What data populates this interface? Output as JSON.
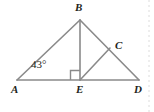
{
  "figure": {
    "kind": "geometry-diagram",
    "background_color": "#ffffff",
    "stroke_color": "#8a8a8a",
    "label_color": "#231f20",
    "guide_color": "#d9d9d9",
    "points": {
      "A": {
        "label": "A",
        "x": 17,
        "y": 80
      },
      "B": {
        "label": "B",
        "x": 80,
        "y": 20
      },
      "C": {
        "label": "C",
        "x": 110,
        "y": 48
      },
      "D": {
        "label": "D",
        "x": 139,
        "y": 80
      },
      "E": {
        "label": "E",
        "x": 80,
        "y": 80
      }
    },
    "segments": [
      {
        "name": "segment-AD",
        "from": "A",
        "to": "D"
      },
      {
        "name": "segment-AB",
        "from": "A",
        "to": "B"
      },
      {
        "name": "segment-BD",
        "from": "B",
        "to": "D"
      },
      {
        "name": "segment-BE",
        "from": "B",
        "to": "E"
      },
      {
        "name": "segment-EC",
        "from": "E",
        "to": "C"
      }
    ],
    "angles": [
      {
        "name": "angle-at-A",
        "vertex": "A",
        "value": "43°"
      },
      {
        "name": "right-angle-at-E",
        "vertex": "E",
        "value": "90°",
        "marker": "square"
      }
    ],
    "guide_line": {
      "name": "dotted-guide",
      "x": 149
    }
  }
}
